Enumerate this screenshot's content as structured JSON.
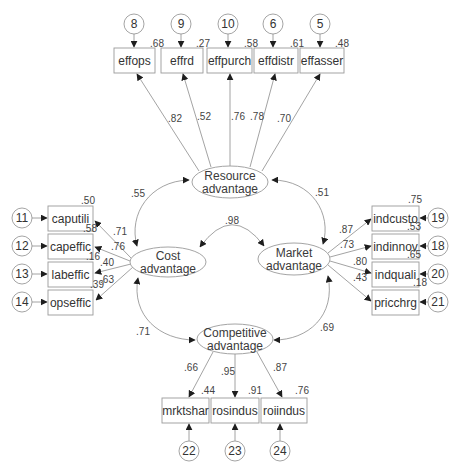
{
  "diagram": {
    "latent": {
      "resource": {
        "line1": "Resource",
        "line2": "advantage"
      },
      "cost": {
        "line1": "Cost",
        "line2": "advantage"
      },
      "market": {
        "line1": "Market",
        "line2": "advantage"
      },
      "competitive": {
        "line1": "Competitive",
        "line2": "advantage"
      }
    },
    "correlations": {
      "cost_resource": ".55",
      "market_resource": ".51",
      "cost_market": ".98",
      "cost_competitive": ".71",
      "market_competitive": ".69"
    },
    "resource_indicators": [
      {
        "name": "effops",
        "loading": ".82",
        "r2": ".68",
        "error": "8"
      },
      {
        "name": "effrd",
        "loading": ".52",
        "r2": ".27",
        "error": "9"
      },
      {
        "name": "effpurch",
        "loading": ".76",
        "r2": ".58",
        "error": "10"
      },
      {
        "name": "effdistr",
        "loading": ".78",
        "r2": ".61",
        "error": "6"
      },
      {
        "name": "effasser",
        "loading": ".70",
        "r2": ".48",
        "error": "5"
      }
    ],
    "cost_indicators": [
      {
        "name": "caputili",
        "loading": ".71",
        "r2": ".50",
        "error": "11"
      },
      {
        "name": "capeffic",
        "loading": ".76",
        "r2": ".58",
        "error": "12"
      },
      {
        "name": "labeffic",
        "loading": ".40",
        "r2": ".16",
        "error": "13"
      },
      {
        "name": "opseffic",
        "loading": ".63",
        "r2": ".39",
        "error": "14"
      }
    ],
    "market_indicators": [
      {
        "name": "indcusto",
        "loading": ".87",
        "r2": ".75",
        "error": "19"
      },
      {
        "name": "indinnov",
        "loading": ".73",
        "r2": ".53",
        "error": "18"
      },
      {
        "name": "indquali",
        "loading": ".80",
        "r2": ".65",
        "error": "20"
      },
      {
        "name": "pricchrg",
        "loading": ".43",
        "r2": ".18",
        "error": "21"
      }
    ],
    "competitive_indicators": [
      {
        "name": "mrktshar",
        "loading": ".66",
        "r2": ".44",
        "error": "22"
      },
      {
        "name": "rosindus",
        "loading": ".95",
        "r2": ".91",
        "error": "23"
      },
      {
        "name": "roiindus",
        "loading": ".87",
        "r2": ".76",
        "error": "24"
      }
    ]
  }
}
